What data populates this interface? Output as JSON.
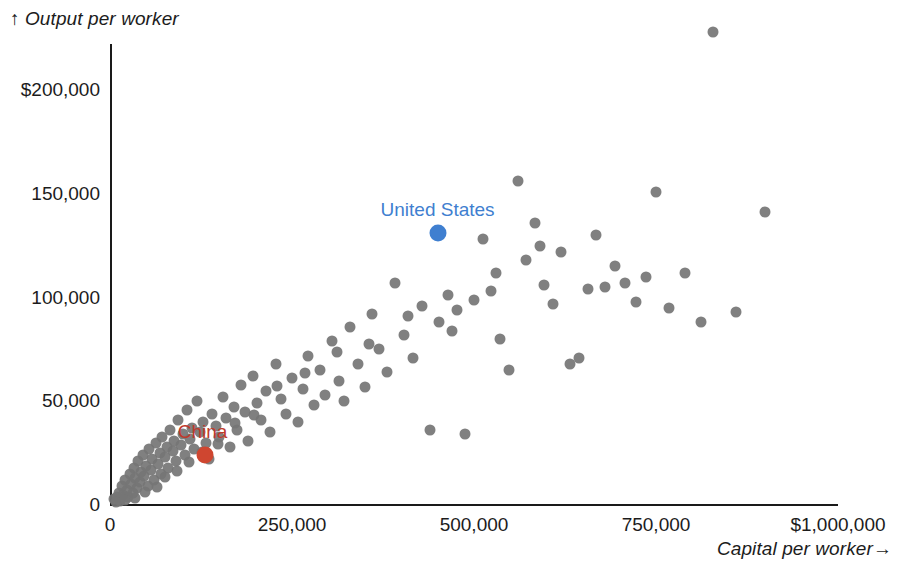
{
  "chart_data": {
    "type": "scatter",
    "title": "",
    "xlabel": "Capital per worker→",
    "ylabel": "↑ Output per worker",
    "xlim": [
      0,
      1000000
    ],
    "ylim": [
      0,
      230000
    ],
    "grid": false,
    "legend": "none",
    "x_ticks": [
      {
        "value": 0,
        "label": "0"
      },
      {
        "value": 250000,
        "label": "250,000"
      },
      {
        "value": 500000,
        "label": "500,000"
      },
      {
        "value": 750000,
        "label": "750,000"
      },
      {
        "value": 1000000,
        "label": "$1,000,000"
      }
    ],
    "y_ticks": [
      {
        "value": 0,
        "label": "0"
      },
      {
        "value": 50000,
        "label": "50,000"
      },
      {
        "value": 100000,
        "label": "100,000"
      },
      {
        "value": 150000,
        "label": "150,000"
      },
      {
        "value": 200000,
        "label": "$200,000"
      }
    ],
    "point_color": "#757575",
    "series": [
      {
        "name": "countries",
        "color": "#757575",
        "points": [
          [
            5000,
            3000
          ],
          [
            9000,
            4000
          ],
          [
            12000,
            6000
          ],
          [
            14000,
            2000
          ],
          [
            16000,
            9000
          ],
          [
            18000,
            5000
          ],
          [
            21000,
            12000
          ],
          [
            23000,
            7000
          ],
          [
            25000,
            4000
          ],
          [
            27000,
            15000
          ],
          [
            29000,
            10000
          ],
          [
            31000,
            6000
          ],
          [
            33000,
            18000
          ],
          [
            35000,
            13000
          ],
          [
            37000,
            8000
          ],
          [
            39000,
            21000
          ],
          [
            41000,
            11000
          ],
          [
            43000,
            16000
          ],
          [
            45000,
            24000
          ],
          [
            47000,
            14000
          ],
          [
            49000,
            19000
          ],
          [
            52000,
            9000
          ],
          [
            54000,
            27000
          ],
          [
            56000,
            17000
          ],
          [
            58000,
            22000
          ],
          [
            61000,
            12000
          ],
          [
            63000,
            30000
          ],
          [
            66000,
            20000
          ],
          [
            68000,
            25000
          ],
          [
            70000,
            15000
          ],
          [
            72000,
            33000
          ],
          [
            75000,
            23000
          ],
          [
            78000,
            28000
          ],
          [
            80000,
            18000
          ],
          [
            83000,
            36000
          ],
          [
            86000,
            26000
          ],
          [
            88000,
            31000
          ],
          [
            91000,
            21000
          ],
          [
            94000,
            41000
          ],
          [
            97000,
            29000
          ],
          [
            100000,
            34000
          ],
          [
            103000,
            24000
          ],
          [
            106000,
            46000
          ],
          [
            110000,
            32000
          ],
          [
            113000,
            37000
          ],
          [
            116000,
            27000
          ],
          [
            120000,
            50000
          ],
          [
            124000,
            35000
          ],
          [
            128000,
            40000
          ],
          [
            132000,
            30000
          ],
          [
            136000,
            22000
          ],
          [
            140000,
            44000
          ],
          [
            145000,
            38000
          ],
          [
            150000,
            33000
          ],
          [
            155000,
            52000
          ],
          [
            160000,
            42000
          ],
          [
            165000,
            28000
          ],
          [
            170000,
            47000
          ],
          [
            175000,
            36000
          ],
          [
            180000,
            58000
          ],
          [
            185000,
            45000
          ],
          [
            190000,
            31000
          ],
          [
            196000,
            62000
          ],
          [
            202000,
            49000
          ],
          [
            208000,
            41000
          ],
          [
            214000,
            55000
          ],
          [
            220000,
            35000
          ],
          [
            228000,
            68000
          ],
          [
            235000,
            51000
          ],
          [
            242000,
            44000
          ],
          [
            250000,
            61000
          ],
          [
            258000,
            40000
          ],
          [
            265000,
            56000
          ],
          [
            272000,
            72000
          ],
          [
            280000,
            48000
          ],
          [
            288000,
            65000
          ],
          [
            296000,
            53000
          ],
          [
            305000,
            79000
          ],
          [
            314000,
            60000
          ],
          [
            322000,
            50000
          ],
          [
            330000,
            86000
          ],
          [
            340000,
            68000
          ],
          [
            350000,
            57000
          ],
          [
            360000,
            92000
          ],
          [
            370000,
            75000
          ],
          [
            380000,
            64000
          ],
          [
            392000,
            107000
          ],
          [
            404000,
            82000
          ],
          [
            416000,
            71000
          ],
          [
            428000,
            96000
          ],
          [
            440000,
            36000
          ],
          [
            452000,
            88000
          ],
          [
            464000,
            101000
          ],
          [
            476000,
            94000
          ],
          [
            488000,
            34000
          ],
          [
            500000,
            99000
          ],
          [
            512000,
            128000
          ],
          [
            524000,
            103000
          ],
          [
            536000,
            80000
          ],
          [
            548000,
            65000
          ],
          [
            560000,
            156000
          ],
          [
            572000,
            118000
          ],
          [
            584000,
            136000
          ],
          [
            596000,
            106000
          ],
          [
            608000,
            97000
          ],
          [
            620000,
            122000
          ],
          [
            632000,
            68000
          ],
          [
            644000,
            71000
          ],
          [
            656000,
            104000
          ],
          [
            668000,
            130000
          ],
          [
            680000,
            105000
          ],
          [
            694000,
            115000
          ],
          [
            708000,
            107000
          ],
          [
            722000,
            98000
          ],
          [
            736000,
            110000
          ],
          [
            750000,
            151000
          ],
          [
            768000,
            95000
          ],
          [
            790000,
            112000
          ],
          [
            812000,
            88000
          ],
          [
            828000,
            228000
          ],
          [
            860000,
            93000
          ],
          [
            900000,
            141000
          ],
          [
            8000,
            1500
          ],
          [
            20000,
            2500
          ],
          [
            34000,
            3500
          ],
          [
            48000,
            6500
          ],
          [
            64000,
            8500
          ],
          [
            76000,
            13500
          ],
          [
            92000,
            16500
          ],
          [
            108000,
            20500
          ],
          [
            126000,
            25500
          ],
          [
            148000,
            29500
          ],
          [
            172000,
            39500
          ],
          [
            198000,
            43500
          ],
          [
            230000,
            57500
          ],
          [
            268000,
            63500
          ],
          [
            312000,
            73500
          ],
          [
            356000,
            77500
          ],
          [
            410000,
            91000
          ],
          [
            470000,
            84000
          ],
          [
            530000,
            112000
          ],
          [
            590000,
            125000
          ]
        ]
      }
    ],
    "highlights": [
      {
        "name": "China",
        "label": "China",
        "x": 130000,
        "y": 24000,
        "color": "#cf4630",
        "label_color": "#c0392b",
        "label_dx": -2,
        "label_dy": -12
      },
      {
        "name": "United States",
        "label": "United States",
        "x": 450000,
        "y": 131000,
        "color": "#3f7fd0",
        "label_color": "#3f7fd0",
        "label_dx": 0,
        "label_dy": -12
      }
    ]
  },
  "axes": {
    "x_axis_name": "capital-per-worker-axis",
    "y_axis_name": "output-per-worker-axis"
  }
}
